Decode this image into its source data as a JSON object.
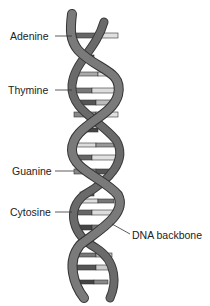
{
  "diagram": {
    "labels": [
      {
        "id": "adenine",
        "text": "Adenine",
        "x": 10,
        "y": 30,
        "line_to": [
          70,
          36
        ]
      },
      {
        "id": "thymine",
        "text": "Thymine",
        "x": 8,
        "y": 84,
        "line_to": [
          70,
          90
        ]
      },
      {
        "id": "guanine",
        "text": "Guanine",
        "x": 12,
        "y": 165,
        "line_to": [
          73,
          171
        ]
      },
      {
        "id": "cytosine",
        "text": "Cytosine",
        "x": 10,
        "y": 206,
        "line_to": [
          70,
          212
        ]
      },
      {
        "id": "backbone",
        "text": "DNA backbone",
        "x": 132,
        "y": 229,
        "line_from": [
          112,
          224
        ]
      }
    ],
    "colors": {
      "backbone": "#6e6e6e",
      "backbone_edge": "#3a3a3a",
      "base_dark": "#4a4a4a",
      "base_mid": "#8a8a8a",
      "base_light": "#d8d8d8",
      "text": "#222222"
    }
  }
}
